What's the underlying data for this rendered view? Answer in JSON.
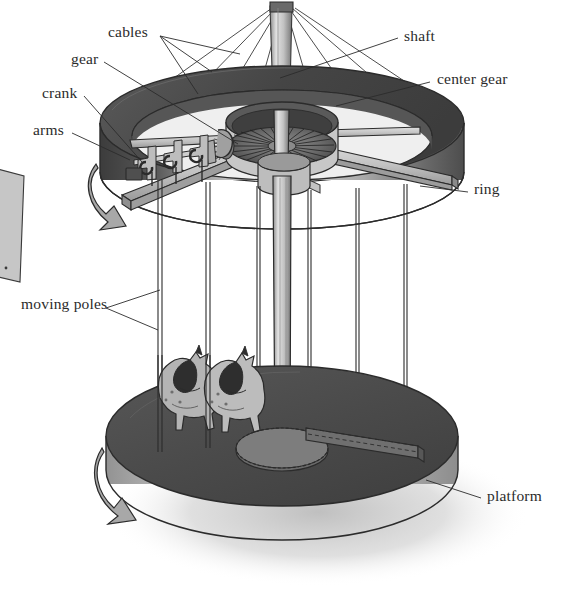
{
  "figure": {
    "type": "technical-illustration",
    "style": "grayscale line-and-tone drawing",
    "background_color": "#ffffff",
    "ink_color": "#2b2b2b"
  },
  "labels": [
    {
      "id": "cables",
      "text": "cables",
      "side": "left",
      "x": 108,
      "y": 31,
      "leader_count": 3
    },
    {
      "id": "gear",
      "text": "gear",
      "side": "left",
      "x": 71,
      "y": 58,
      "leader_count": 1
    },
    {
      "id": "crank",
      "text": "crank",
      "side": "left",
      "x": 42,
      "y": 92,
      "leader_count": 1
    },
    {
      "id": "arms",
      "text": "arms",
      "side": "left",
      "x": 33,
      "y": 128,
      "leader_count": 1
    },
    {
      "id": "moving-poles",
      "text": "moving poles",
      "side": "left",
      "x": 21,
      "y": 302,
      "leader_count": 2
    },
    {
      "id": "shaft",
      "text": "shaft",
      "side": "right",
      "x": 404,
      "y": 35,
      "leader_count": 1
    },
    {
      "id": "center-gear",
      "text": "center gear",
      "side": "right",
      "x": 437,
      "y": 78,
      "leader_count": 1
    },
    {
      "id": "ring",
      "text": "ring",
      "side": "right",
      "x": 474,
      "y": 188,
      "leader_count": 1
    },
    {
      "id": "platform",
      "text": "platform",
      "side": "right",
      "x": 487,
      "y": 495,
      "leader_count": 1
    }
  ],
  "parts": {
    "shaft": {
      "name": "shaft",
      "description": "vertical central mast running from top apex down through the ring to the platform hub"
    },
    "cables": {
      "name": "cables",
      "description": "thin guy lines fanning from the top of the shaft down to the outer rim of the ring"
    },
    "ring": {
      "name": "ring",
      "description": "large horizontal drum / canopy band suspended near the top that carries the arms"
    },
    "center_gear": {
      "name": "center gear",
      "description": "bevel crown gear inside a cylindrical housing at the centre of the ring, driven by the shaft"
    },
    "gear": {
      "name": "gear",
      "description": "pinion gear meshing with the center gear"
    },
    "crank": {
      "name": "crank",
      "description": "offset crankshaft with connecting rods that lifts and lowers the moving poles"
    },
    "arms": {
      "name": "arms",
      "description": "four radial beams spanning the ring from the centre housing to the rim"
    },
    "moving_poles": {
      "name": "moving poles",
      "description": "vertical rods that hang from the ring through the platform and carry the horses up and down"
    },
    "platform": {
      "name": "platform",
      "description": "large rotating disc floor at the bottom carrying the horses and bench"
    },
    "horses": {
      "name": "horses",
      "count": 2,
      "description": "two carousel horses with dark manes on moving poles"
    },
    "bench": {
      "name": "bench rail",
      "description": "slotted rail set into the platform where poles pass through"
    }
  },
  "motion_indicators": [
    {
      "id": "ring-rotation-arrow",
      "description": "curved arrow on the left edge of the ring indicating rotation"
    },
    {
      "id": "platform-rotation-arrow",
      "description": "curved arrow on the left edge of the platform indicating rotation"
    }
  ],
  "palette": {
    "ink": "#2b2b2b",
    "ring_top": "#4a4a4a",
    "ring_band_dark": "#3a3a3a",
    "ring_band_lit": "#c9c9c9",
    "platform_top": "#4d4d4d",
    "platform_edge": "#b5b5b5",
    "metal_light": "#d8d8d8",
    "metal_mid": "#a8a8a8",
    "metal_dark": "#6e6e6e",
    "shadow": "#d5d5d5",
    "horse_body": "#b8b8b8",
    "horse_mane": "#2e2e2e"
  }
}
